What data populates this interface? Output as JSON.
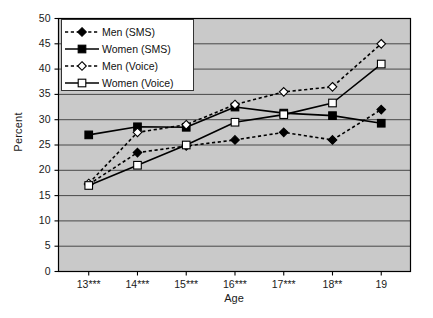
{
  "chart_data": {
    "type": "line",
    "title": "",
    "xlabel": "Age",
    "ylabel": "Percent",
    "categories": [
      "13***",
      "14***",
      "15***",
      "16***",
      "17***",
      "18**",
      "19"
    ],
    "x_values": [
      13,
      14,
      15,
      16,
      17,
      18,
      19
    ],
    "ylim": [
      0,
      50
    ],
    "yticks": [
      0,
      5,
      10,
      15,
      20,
      25,
      30,
      35,
      40,
      45,
      50
    ],
    "grid": "horizontal",
    "legend_position": "top-left inside plot",
    "plot_background": "#c9c9c9",
    "series": [
      {
        "name": "Men (SMS)",
        "marker": "filled-diamond",
        "linestyle": "dashed",
        "color": "#000000",
        "values": [
          17.2,
          23.5,
          24.8,
          26.0,
          27.5,
          26.0,
          32.0
        ]
      },
      {
        "name": "Women (SMS)",
        "marker": "filled-square",
        "linestyle": "solid",
        "color": "#000000",
        "values": [
          27.0,
          28.6,
          28.5,
          32.5,
          31.3,
          30.8,
          29.3
        ]
      },
      {
        "name": "Men (Voice)",
        "marker": "open-diamond",
        "linestyle": "dashed",
        "color": "#000000",
        "values": [
          17.4,
          27.5,
          29.0,
          33.0,
          35.5,
          36.5,
          45.0
        ]
      },
      {
        "name": "Women (Voice)",
        "marker": "open-square",
        "linestyle": "solid",
        "color": "#000000",
        "values": [
          17.0,
          21.0,
          25.0,
          29.5,
          31.0,
          33.3,
          41.0
        ]
      }
    ]
  },
  "legend": {
    "items": [
      {
        "label": "Men (SMS)"
      },
      {
        "label": "Women (SMS)"
      },
      {
        "label": "Men (Voice)"
      },
      {
        "label": "Women (Voice)"
      }
    ]
  }
}
